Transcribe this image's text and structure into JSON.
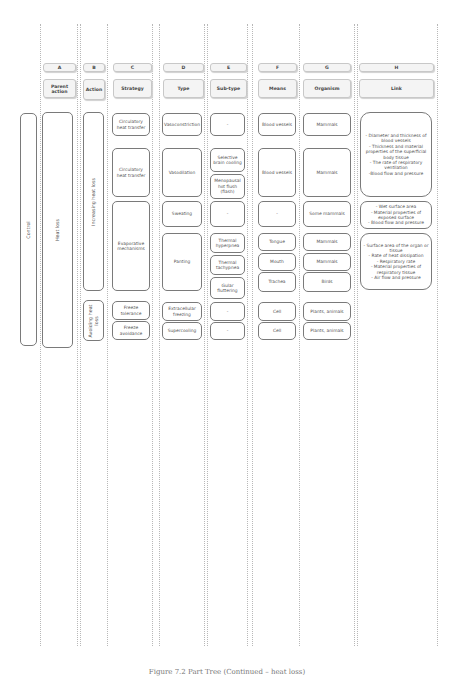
{
  "columns": [
    {
      "letter": "A",
      "title": "Parent action"
    },
    {
      "letter": "B",
      "title": "Action"
    },
    {
      "letter": "C",
      "title": "Strategy"
    },
    {
      "letter": "D",
      "title": "Type"
    },
    {
      "letter": "E",
      "title": "Sub-type"
    },
    {
      "letter": "F",
      "title": "Means"
    },
    {
      "letter": "G",
      "title": "Organism"
    },
    {
      "letter": "H",
      "title": "Link"
    }
  ],
  "root": "Control",
  "parent_action": "Heat loss",
  "actions": [
    "Increasing heat loss",
    "Avoiding heat loss"
  ],
  "strategies": [
    "Circulatory heat transfer",
    "Circulatory heat transfer",
    "Evaporative mechanisms",
    "Freeze tolerance",
    "Freeze avoidance"
  ],
  "types": [
    "Vasoconstriction",
    "Vasodilation",
    "Sweating",
    "Panting",
    "Extracellular freezing",
    "Supercooling"
  ],
  "subtypes": [
    "-",
    "Selective brain cooling",
    "Menopausal hot flush (flash)",
    "-",
    "Thermal hyperpnea",
    "Thermal tachypnea",
    "Gular fluttering",
    "-",
    "-"
  ],
  "means": [
    "Blood vessels",
    "Blood vessels",
    "-",
    "Tongue",
    "Mouth",
    "Trachea",
    "Cell",
    "Cell"
  ],
  "organisms": [
    "Mammals",
    "Mammals",
    "Some mammals",
    "Mammals",
    "Mammals",
    "Birds",
    "Plants, animals",
    "Plants, animals"
  ],
  "links": [
    "- Diameter and thickness of blood vessels\n- Thickness and material properties of the superficial body tissue\n- The rate of respiratory ventilation\n-Blood flow and pressure",
    "- Wet surface area\n- Material properties of exposed surface\n- Blood flow and pressure",
    "- Surface area of the organ or tissue\n- Rate of heat dissipation\n- Respiratory rate\n- Material properties of respiratory tissue\n- Air flow and pressure"
  ],
  "caption": "Figure 7.2 Part Tree (Continued – heat loss)"
}
